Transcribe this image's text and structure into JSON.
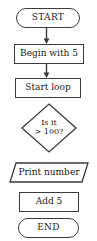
{
  "diagram": {
    "type": "flowchart",
    "orientation": "vertical",
    "canvas": {
      "width": 97,
      "height": 241,
      "background": "#ffffff"
    },
    "style": {
      "stroke": "#3a3a3a",
      "text": "#1a1a1a",
      "fill": "#ffffff"
    },
    "nodes": [
      {
        "id": "start",
        "shape": "terminator",
        "label": "START",
        "x": 16,
        "y": 8,
        "w": 64,
        "h": 20
      },
      {
        "id": "begin-with-5",
        "shape": "process",
        "label": "Begin with 5",
        "x": 14,
        "y": 44,
        "w": 70,
        "h": 20
      },
      {
        "id": "start-loop",
        "shape": "process",
        "label": "Start loop",
        "x": 15,
        "y": 78,
        "w": 66,
        "h": 20
      },
      {
        "id": "is-it-greater-than-100",
        "shape": "decision",
        "label_line1": "Is it",
        "label_line2": "> 100?",
        "x": 21,
        "y": 103,
        "w": 56,
        "h": 50
      },
      {
        "id": "print-number",
        "shape": "parallelogram",
        "label": "Print number",
        "x": 9,
        "y": 162,
        "w": 80,
        "h": 21
      },
      {
        "id": "add-5",
        "shape": "process",
        "label": "Add 5",
        "x": 19,
        "y": 192,
        "w": 60,
        "h": 20
      },
      {
        "id": "end",
        "shape": "terminator",
        "label": "END",
        "x": 18,
        "y": 218,
        "w": 61,
        "h": 20
      }
    ],
    "connectors": [
      {
        "id": "start-to-begin",
        "from": "start",
        "to": "begin-with-5",
        "arrow": true,
        "x": 46,
        "y": 28,
        "length": 16
      },
      {
        "id": "begin-to-loop",
        "from": "begin-with-5",
        "to": "start-loop",
        "arrow": true,
        "x": 46,
        "y": 64,
        "length": 14
      }
    ]
  }
}
